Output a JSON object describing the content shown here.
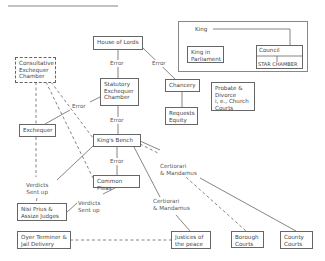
{
  "diagram": {
    "title_rule": true,
    "nodes": {
      "consultative": "Consultative\nExchequer\nChamber",
      "house_of_lords": "House of Lords",
      "statutory": "Statutory\nExchequer\nChamber",
      "exchequer": "Exchequer",
      "chancery": "Chancery",
      "requests": "Requests\nEquity",
      "probate": "Probate &\nDivorce\ni, e., Church\nCourts",
      "kings_bench": "King's Bench",
      "common_pleas": "Common Pleas",
      "nisi_prius": "Nisi Prius &\nAssize Judges",
      "oyer": "Oyer Terminer &\nJail Delivery",
      "justices": "Justices of\nthe peace",
      "borough": "Borough\nCourts",
      "county": "County\nCourts"
    },
    "king_panel": {
      "king": "King",
      "king_in_parliament": "King in\nParliament",
      "council": "Council",
      "star_chamber": "STAR CHAMBER"
    },
    "edge_labels": {
      "error_hol_statutory": "Error",
      "error_hol_chancery": "Error",
      "error_exchequer_statutory": "Error",
      "error_statutory_kb": "Error",
      "error_kb_cp": "Error",
      "certiorari_kb_borough": "Certiorari\n& Mandamus",
      "certiorari_kb_justices": "Certiorari\n& Mandamus",
      "verdicts_left": "Verdicts\nSent up",
      "verdicts_right": "Verdicts\nSent up"
    },
    "colors": {
      "line": "#666666",
      "text": "#444444",
      "background": "#ffffff"
    }
  }
}
